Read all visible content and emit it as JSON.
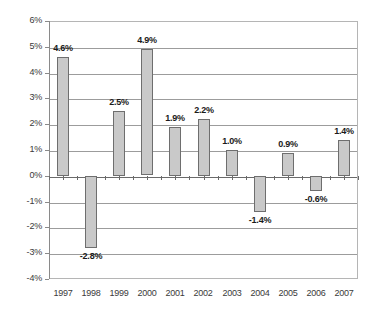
{
  "chart_data": {
    "type": "bar",
    "title": "",
    "subtitle": "",
    "xlabel": "",
    "ylabel": "",
    "categories": [
      "1997",
      "1998",
      "1999",
      "2000",
      "2001",
      "2002",
      "2003",
      "2004",
      "2005",
      "2006",
      "2007"
    ],
    "values": [
      4.6,
      -2.8,
      2.5,
      4.9,
      1.9,
      2.2,
      1.0,
      -1.4,
      0.9,
      -0.6,
      1.4
    ],
    "data_labels": [
      "4.6%",
      "-2.8%",
      "2.5%",
      "4.9%",
      "1.9%",
      "2.2%",
      "1.0%",
      "-1.4%",
      "0.9%",
      "-0.6%",
      "1.4%"
    ],
    "ylim": [
      -4,
      6
    ],
    "ytick_values": [
      6,
      5,
      4,
      3,
      2,
      1,
      0,
      -1,
      -2,
      -3,
      -4
    ],
    "ytick_labels": [
      "6%",
      "5%",
      "4%",
      "3%",
      "2%",
      "1%",
      "0%",
      "-1%",
      "-2%",
      "-3%",
      "-4%"
    ],
    "grid": true,
    "legend": false,
    "legend_position": "none",
    "bar_fill_color": "#c9c9c9",
    "bar_border_color": "#6e6e6e",
    "gridline_color": "#9c9c9c",
    "zero_line_color": "#6a6a6a",
    "axis_color": "#8a8a8a",
    "plot_border_color": "#b5b5b5",
    "background_color": "#ffffff",
    "label_text_color": "#1a1a1a",
    "tick_text_color": "#3a3a3a"
  }
}
